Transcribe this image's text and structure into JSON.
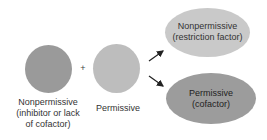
{
  "diagram": {
    "inputs": [
      {
        "id": "nonpermissive-cell",
        "label_line1": "Nonpermissive",
        "label_line2": "(inhibitor or lack",
        "label_line3": "of cofactor)",
        "color": "#9a9a9a"
      },
      {
        "id": "permissive-cell",
        "label_line1": "Permissive",
        "color": "#bdbdbd"
      }
    ],
    "operator": "+",
    "outcomes": [
      {
        "id": "nonpermissive-outcome",
        "label_line1": "Nonpermissive",
        "label_line2": "(restriction factor)",
        "color": "#c9c9c9"
      },
      {
        "id": "permissive-outcome",
        "label_line1": "Permissive",
        "label_line2": "(cofactor)",
        "color": "#9c9c9c"
      }
    ],
    "arrow_color": "#222222"
  }
}
